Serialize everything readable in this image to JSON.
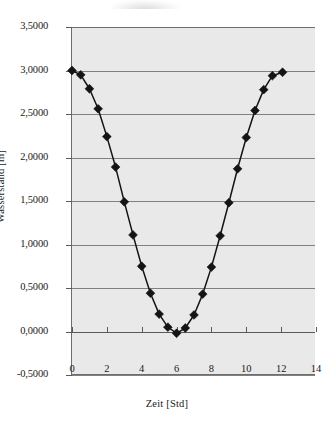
{
  "chart_data": {
    "type": "line",
    "title": "",
    "subtitle": "",
    "xlabel": "Zeit [Std]",
    "ylabel": "Wasserstand [m]",
    "xlim": [
      0,
      14
    ],
    "ylim": [
      -0.5,
      3.5
    ],
    "grid": "horizontal",
    "legend": "none",
    "marker": "filled-diamond",
    "line_color": "#141414",
    "marker_color": "#141414",
    "plot_background": "#e9e9e9",
    "gridline_color": "#808080",
    "x_tick_labels": [
      "0",
      "2",
      "4",
      "6",
      "8",
      "10",
      "12",
      "14"
    ],
    "x_tick_values": [
      0,
      2,
      4,
      6,
      8,
      10,
      12,
      14
    ],
    "y_tick_labels": [
      "3,5000",
      "3,0000",
      "2,5000",
      "2,0000",
      "1,5000",
      "1,0000",
      "0,5000",
      "0,0000",
      "-0,5000"
    ],
    "y_tick_values": [
      3.5,
      3.0,
      2.5,
      2.0,
      1.5,
      1.0,
      0.5,
      0.0,
      -0.5
    ],
    "series": [
      {
        "name": "Wasserstand",
        "x": [
          0.0,
          0.5,
          1.0,
          1.5,
          2.0,
          2.5,
          3.0,
          3.5,
          4.0,
          4.5,
          5.0,
          5.5,
          6.0,
          6.5,
          7.0,
          7.5,
          8.0,
          8.5,
          9.0,
          9.5,
          10.0,
          10.5,
          11.0,
          11.5,
          12.08
        ],
        "values": [
          3.0,
          2.95,
          2.79,
          2.56,
          2.24,
          1.89,
          1.49,
          1.11,
          0.75,
          0.44,
          0.2,
          0.05,
          -0.02,
          0.04,
          0.19,
          0.43,
          0.74,
          1.1,
          1.48,
          1.87,
          2.23,
          2.54,
          2.78,
          2.94,
          2.98
        ]
      }
    ]
  }
}
